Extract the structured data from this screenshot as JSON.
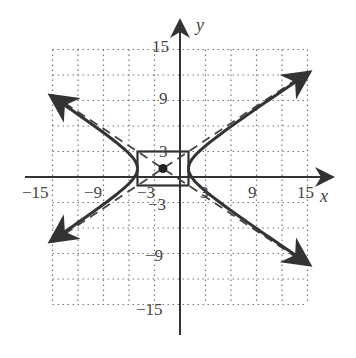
{
  "chart_data": {
    "type": "line",
    "title": "",
    "xlabel": "x",
    "ylabel": "y",
    "xlim": [
      -15,
      15
    ],
    "ylim": [
      -15,
      15
    ],
    "grid": true,
    "grid_step": 3,
    "x_tick_labels": [
      "-15",
      "-9",
      "-3",
      "3",
      "9",
      "15"
    ],
    "y_tick_labels": [
      "15",
      "9",
      "3",
      "-3",
      "-9",
      "-15"
    ],
    "curve": {
      "kind": "hyperbola",
      "orientation": "horizontal",
      "center": [
        -2,
        1
      ],
      "a": 3,
      "b": 2
    },
    "center_point": [
      -2,
      1
    ],
    "fundamental_rectangle": {
      "x": [
        -5,
        1
      ],
      "y": [
        -1,
        3
      ]
    },
    "asymptotes": [
      "y - 1 = (2/3)(x + 2)",
      "y - 1 = -(2/3)(x + 2)"
    ]
  },
  "labels": {
    "x_axis": "x",
    "y_axis": "y",
    "x_neg15": "−15",
    "x_neg9": "−9",
    "x_neg3": "−3",
    "x_3": "3",
    "x_9": "9",
    "x_15": "15",
    "y_15": "15",
    "y_9": "9",
    "y_3": "3",
    "y_neg3": "−3",
    "y_neg9": "−9",
    "y_neg15": "−15"
  }
}
